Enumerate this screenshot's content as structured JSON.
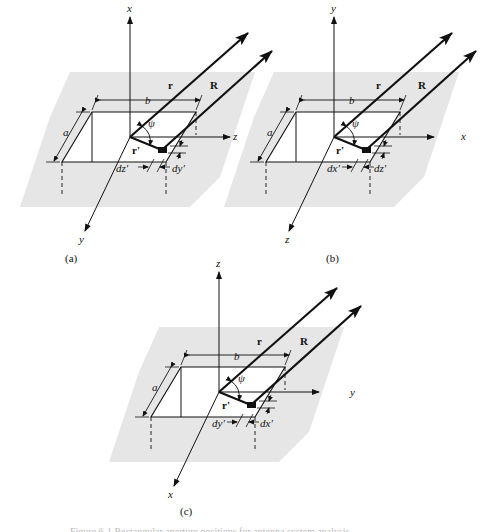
{
  "figure": {
    "panels": [
      {
        "id": "a",
        "caption": "(a)",
        "axes": {
          "up": "x",
          "right": "z",
          "out": "y"
        },
        "labels": {
          "r": "r",
          "R": "R",
          "r_prime": "r'",
          "psi": "ψ",
          "a": "a",
          "b": "b",
          "d1": "dz'",
          "d2": "dy'"
        }
      },
      {
        "id": "b",
        "caption": "(b)",
        "axes": {
          "up": "y",
          "right": "x",
          "out": "z"
        },
        "labels": {
          "r": "r",
          "R": "R",
          "r_prime": "r'",
          "psi": "ψ",
          "a": "a",
          "b": "b",
          "d1": "dx'",
          "d2": "dz'"
        }
      },
      {
        "id": "c",
        "caption": "(c)",
        "axes": {
          "up": "z",
          "right": "y",
          "out": "x"
        },
        "labels": {
          "r": "r",
          "R": "R",
          "r_prime": "r'",
          "psi": "ψ",
          "a": "a",
          "b": "b",
          "d1": "dy'",
          "d2": "dx'"
        }
      }
    ],
    "caption_partial": "Figure 6-1  Rectangular aperture positions for antenna system analysis."
  },
  "colors": {
    "ground_plane": "#e6e6e6",
    "lines": "#111111"
  }
}
